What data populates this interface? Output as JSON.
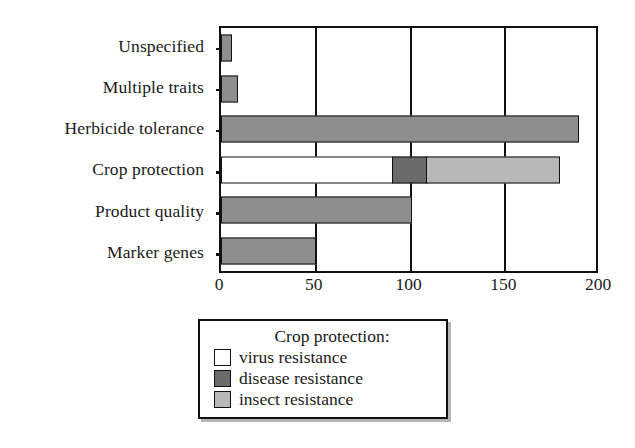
{
  "chart_data": {
    "type": "bar",
    "orientation": "horizontal",
    "stacked": true,
    "title": "",
    "subtitle": "",
    "xlabel": "",
    "ylabel": "",
    "xlim": [
      0,
      200
    ],
    "ylim": null,
    "grid": true,
    "gridlines_x": [
      50,
      100,
      150
    ],
    "xticks": [
      "0",
      "50",
      "100",
      "150",
      "200"
    ],
    "xtick_values": [
      0,
      50,
      100,
      150,
      200
    ],
    "categories": [
      "Unspecified",
      "Multiple traits",
      "Herbicide tolerance",
      "Crop protection",
      "Product quality",
      "Marker genes"
    ],
    "series": [
      {
        "name": "main",
        "legend_label": "",
        "color": "#8e8e8e",
        "values": [
          6,
          9,
          189,
          0,
          101,
          50
        ]
      },
      {
        "name": "virus resistance",
        "legend_label": "virus resistance",
        "color": "#ffffff",
        "values": [
          0,
          0,
          0,
          91,
          0,
          0
        ]
      },
      {
        "name": "disease resistance",
        "legend_label": "disease resistance",
        "color": "#6b6b6b",
        "values": [
          0,
          0,
          0,
          18,
          0,
          0
        ]
      },
      {
        "name": "insect resistance",
        "legend_label": "insect resistance",
        "color": "#b8b8b8",
        "values": [
          0,
          0,
          0,
          70,
          0,
          0
        ]
      }
    ],
    "bars": [
      {
        "category": "Unspecified",
        "total": 6,
        "segments": [
          {
            "label": "",
            "value": 6,
            "color": "#8e8e8e"
          }
        ]
      },
      {
        "category": "Multiple traits",
        "total": 9,
        "segments": [
          {
            "label": "",
            "value": 9,
            "color": "#8e8e8e"
          }
        ]
      },
      {
        "category": "Herbicide tolerance",
        "total": 189,
        "segments": [
          {
            "label": "",
            "value": 189,
            "color": "#8e8e8e"
          }
        ]
      },
      {
        "category": "Crop protection",
        "total": 179,
        "segments": [
          {
            "label": "virus resistance",
            "value": 91,
            "color": "#ffffff"
          },
          {
            "label": "disease resistance",
            "value": 18,
            "color": "#6b6b6b"
          },
          {
            "label": "insect resistance",
            "value": 70,
            "color": "#b8b8b8"
          }
        ]
      },
      {
        "category": "Product quality",
        "total": 101,
        "segments": [
          {
            "label": "",
            "value": 101,
            "color": "#8e8e8e"
          }
        ]
      },
      {
        "category": "Marker genes",
        "total": 50,
        "segments": [
          {
            "label": "",
            "value": 50,
            "color": "#8e8e8e"
          }
        ]
      }
    ],
    "legend": {
      "position": "below-center",
      "title": "Crop protection:",
      "entries": [
        {
          "label": "virus resistance",
          "color": "#ffffff"
        },
        {
          "label": "disease resistance",
          "color": "#6b6b6b"
        },
        {
          "label": "insect resistance",
          "color": "#b8b8b8"
        }
      ]
    },
    "colors": {
      "axis": "#111111",
      "background": "#ffffff",
      "bar_default": "#8e8e8e",
      "virus": "#ffffff",
      "disease": "#6b6b6b",
      "insect": "#b8b8b8"
    }
  }
}
